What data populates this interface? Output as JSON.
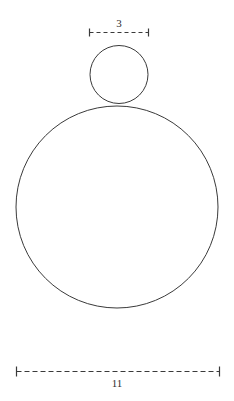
{
  "figure": {
    "type": "geometry-diagram",
    "background_color": "#ffffff",
    "stroke_color": "#3a3a3a",
    "stroke_width": 1,
    "canvas": {
      "width": 234,
      "height": 401
    },
    "shapes": [
      {
        "name": "small-circle",
        "kind": "circle",
        "cx": 119,
        "cy": 74.5,
        "r": 29,
        "diameter_label": "3"
      },
      {
        "name": "large-circle",
        "kind": "circle",
        "cx": 117,
        "cy": 207,
        "r": 101,
        "diameter_label": "11"
      }
    ],
    "tangent_point": {
      "x": 119,
      "y": 105
    },
    "dimensions": [
      {
        "name": "small-circle-dimension",
        "value": "3",
        "orientation": "horizontal",
        "y": 32,
        "x1": 89,
        "x2": 148,
        "tick_half_height": 4,
        "label_position": "above",
        "line_style": "dashed"
      },
      {
        "name": "large-circle-dimension",
        "value": "11",
        "orientation": "horizontal",
        "y": 371,
        "x1": 16,
        "x2": 219,
        "tick_half_height": 5,
        "label_position": "below",
        "line_style": "dashed"
      }
    ]
  },
  "labels": {
    "small_diameter": "3",
    "large_diameter": "11"
  }
}
